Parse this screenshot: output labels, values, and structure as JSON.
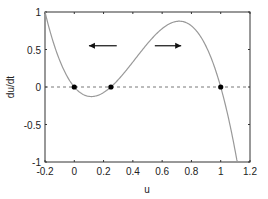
{
  "chart_data": {
    "type": "line",
    "title": "",
    "xlabel": "u",
    "ylabel": "du/dt",
    "xlim": [
      -0.2,
      1.2
    ],
    "ylim": [
      -1,
      1
    ],
    "grid": false,
    "x_ticks": [
      -0.2,
      0,
      0.2,
      0.4,
      0.6,
      0.8,
      1,
      1.2
    ],
    "x_tick_labels": [
      "-0.2",
      "0",
      "0.2",
      "0.4",
      "0.6",
      "0.8",
      "1",
      "1.2"
    ],
    "y_ticks": [
      -1,
      -0.5,
      0,
      0.5,
      1
    ],
    "y_tick_labels": [
      "-1",
      "-0.5",
      "0",
      "0.5",
      "1"
    ],
    "series": [
      {
        "name": "du/dt = f(u)",
        "style": "solid",
        "color": "#999999",
        "x": [
          -0.2,
          -0.1,
          0,
          0.1,
          0.12,
          0.2,
          0.25,
          0.3,
          0.4,
          0.5,
          0.6,
          0.7,
          0.8,
          0.9,
          1.0,
          1.05,
          1.1,
          1.115
        ],
        "y": [
          1.0,
          0.36,
          0,
          -0.13,
          -0.13,
          -0.07,
          0,
          0.1,
          0.37,
          0.58,
          0.78,
          0.88,
          0.82,
          0.54,
          0,
          -0.4,
          -0.87,
          -1.0
        ]
      },
      {
        "name": "zero line",
        "style": "dashed",
        "color": "#666666",
        "x": [
          -0.2,
          1.2
        ],
        "y": [
          0,
          0
        ]
      }
    ],
    "equilibria": [
      {
        "u": 0,
        "du_dt": 0
      },
      {
        "u": 0.25,
        "du_dt": 0
      },
      {
        "u": 1,
        "du_dt": 0
      }
    ],
    "annotations": [
      {
        "type": "arrow",
        "direction": "left",
        "x_from": 0.29,
        "x_to": 0.1,
        "y": 0.55
      },
      {
        "type": "arrow",
        "direction": "right",
        "x_from": 0.55,
        "x_to": 0.73,
        "y": 0.55
      }
    ]
  },
  "colors": {
    "curve": "#999999",
    "axes": "#333333",
    "dashed": "#555555",
    "dots": "#000000",
    "arrows": "#111111"
  }
}
